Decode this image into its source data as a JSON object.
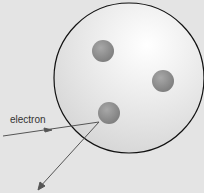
{
  "diagram": {
    "type": "plum-pudding-atom-electron-scattering",
    "labels": {
      "electron": "electron"
    },
    "colors": {
      "background": "#e4e4e4",
      "sphere_fill_center": "#ffffff",
      "sphere_fill_edge": "#d6d6d6",
      "sphere_outline": "#111111",
      "particle": "#8f8f8f",
      "arrow": "#555555"
    },
    "particles_count": 3
  }
}
